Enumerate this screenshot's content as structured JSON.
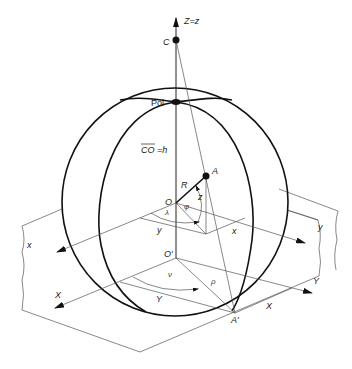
{
  "diagram": {
    "type": "geometric-projection",
    "labels": {
      "z_axis": "Z=z",
      "center_of_projection": "C",
      "pole": "Pol",
      "co_eq_h": "CO = h",
      "co_overline": "CO",
      "h": "=h",
      "sphere_center": "O",
      "point": "A",
      "radius": "R",
      "phi": "φ",
      "z": "z",
      "lambda": "λ",
      "small_x_axis": "x",
      "small_y_axis": "y",
      "small_y_seg": "y",
      "small_x_seg": "x",
      "plane_origin": "O'",
      "nu": "ν",
      "rho": "ρ",
      "big_x_axis": "X",
      "big_y_axis": "Y",
      "big_y_seg": "Y",
      "big_x_seg": "X",
      "projected_point": "A'"
    }
  }
}
